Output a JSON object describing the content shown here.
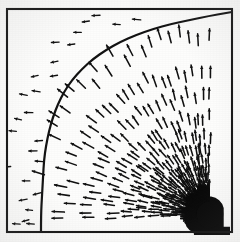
{
  "figure": {
    "title": "",
    "kind": "vector-field-quiver-plot",
    "background_color": "#fdfdfc",
    "ink_color": "#101010"
  },
  "frame": {
    "x": 7,
    "y": 9,
    "width": 225,
    "height": 223,
    "stroke_color": "#151515",
    "stroke_width": 2.1
  },
  "chart_data": {
    "type": "scatter",
    "title": "",
    "xlabel": "",
    "ylabel": "",
    "grid": false,
    "legend_position": "none",
    "xlim": [
      7,
      232
    ],
    "ylim": [
      9,
      232
    ],
    "source_point": {
      "x": 209,
      "y": 214,
      "radius": 15,
      "color": "#080808"
    },
    "arc": {
      "label": "boundary-arc",
      "stroke_color": "#121212",
      "stroke_width": 2.2,
      "points": [
        [
          41,
          232
        ],
        [
          41,
          214
        ],
        [
          42,
          196
        ],
        [
          43,
          178
        ],
        [
          44,
          160
        ],
        [
          46,
          146
        ],
        [
          49,
          131
        ],
        [
          53,
          117
        ],
        [
          58,
          104
        ],
        [
          64,
          92
        ],
        [
          72,
          80
        ],
        [
          82,
          69
        ],
        [
          93,
          59
        ],
        [
          106,
          50
        ],
        [
          120,
          42
        ],
        [
          136,
          35
        ],
        [
          153,
          29
        ],
        [
          171,
          24
        ],
        [
          190,
          20
        ],
        [
          209,
          16
        ],
        [
          226,
          13
        ],
        [
          232,
          12
        ]
      ]
    },
    "arrow_length": 9.5,
    "arrow_head": 3.2,
    "rays": {
      "count": 30,
      "angle_start_deg": 90,
      "angle_end_deg": 182,
      "samples_per_ray": 13,
      "radius_min": 17,
      "radius_max": 215
    },
    "series": [
      {
        "name": "inner-field",
        "description": "arrows inside arc radiate outward from source",
        "direction": "radial-outward"
      },
      {
        "name": "outer-field",
        "description": "arrows outside arc drift leftward / horizontal",
        "direction": "leftward"
      }
    ]
  }
}
